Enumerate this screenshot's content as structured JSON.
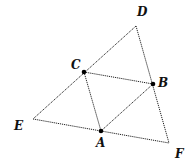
{
  "diagram": {
    "type": "geometry-triangle-midpoints",
    "points": {
      "D": {
        "label": "D",
        "x": 136,
        "y": 26,
        "marked": false
      },
      "C": {
        "label": "C",
        "x": 84,
        "y": 72,
        "marked": true
      },
      "B": {
        "label": "B",
        "x": 153,
        "y": 84,
        "marked": true
      },
      "A": {
        "label": "A",
        "x": 101,
        "y": 131,
        "marked": true
      },
      "E": {
        "label": "E",
        "x": 33,
        "y": 119,
        "marked": false
      },
      "F": {
        "label": "F",
        "x": 169,
        "y": 143,
        "marked": false
      }
    },
    "segments": [
      [
        "D",
        "E"
      ],
      [
        "D",
        "F"
      ],
      [
        "E",
        "F"
      ],
      [
        "C",
        "B"
      ],
      [
        "C",
        "A"
      ],
      [
        "A",
        "B"
      ]
    ],
    "labels": {
      "D": "D",
      "C": "C",
      "B": "B",
      "A": "A",
      "E": "E",
      "F": "F"
    }
  }
}
